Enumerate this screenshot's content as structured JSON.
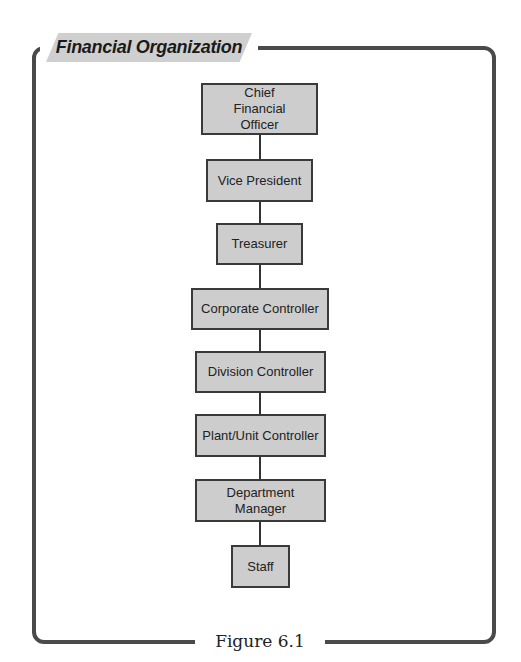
{
  "figure": {
    "title": "Financial Organization",
    "caption": "Figure 6.1"
  },
  "colors": {
    "frame": "#4a4a4a",
    "node_fill": "#cdcdcd",
    "node_border": "#3a3a3a",
    "title_tab": "#cfcfcf"
  },
  "nodes": [
    {
      "label": "Chief Financial Officer",
      "level": 1
    },
    {
      "label": "Vice President",
      "level": 2
    },
    {
      "label": "Treasurer",
      "level": 3
    },
    {
      "label": "Corporate Controller",
      "level": 4
    },
    {
      "label": "Division Controller",
      "level": 5
    },
    {
      "label": "Plant/Unit Controller",
      "level": 6
    },
    {
      "label": "Department Manager",
      "level": 7
    },
    {
      "label": "Staff",
      "level": 8
    }
  ],
  "edges": [
    [
      "Chief Financial Officer",
      "Vice President"
    ],
    [
      "Vice President",
      "Treasurer"
    ],
    [
      "Treasurer",
      "Corporate Controller"
    ],
    [
      "Corporate Controller",
      "Division Controller"
    ],
    [
      "Division Controller",
      "Plant/Unit Controller"
    ],
    [
      "Plant/Unit Controller",
      "Department Manager"
    ],
    [
      "Department Manager",
      "Staff"
    ]
  ]
}
